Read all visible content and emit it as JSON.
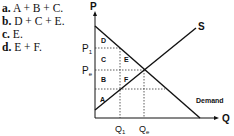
{
  "options": [
    {
      "letter": "a.",
      "text": "A + B + C."
    },
    {
      "letter": "b.",
      "text": "D + C + E."
    },
    {
      "letter": "c.",
      "text": "E."
    },
    {
      "letter": "d.",
      "text": "E + F."
    }
  ],
  "diagram": {
    "y_axis": "P",
    "x_axis": "Q",
    "supply_label": "S",
    "demand_label": "Demand",
    "price_labels": {
      "p1": "P",
      "p1_sub": "1",
      "pe": "P",
      "pe_sub": "e"
    },
    "quantity_labels": {
      "q1": "Q",
      "q1_sub": "1",
      "qe": "Q",
      "qe_sub": "e"
    },
    "regions": [
      "A",
      "B",
      "C",
      "D",
      "E",
      "F"
    ]
  }
}
